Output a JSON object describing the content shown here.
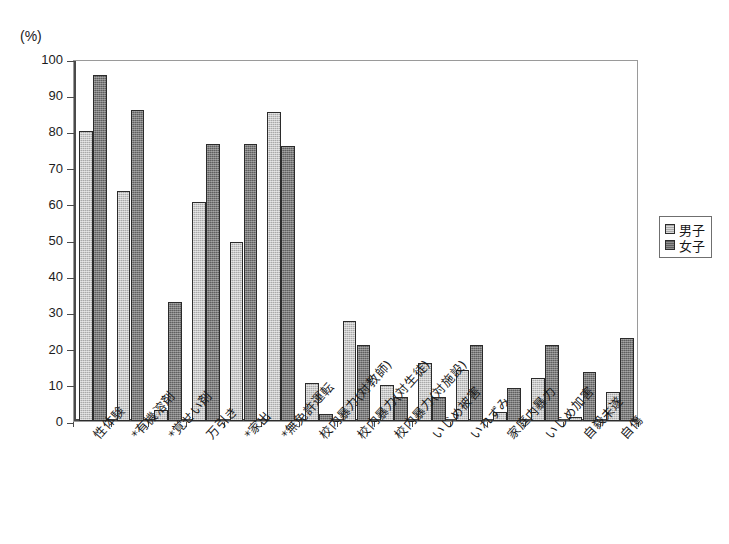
{
  "chart_data": {
    "type": "bar",
    "title": "",
    "xlabel": "",
    "ylabel": "(%)",
    "unit_label": "(%)",
    "ylim": [
      0,
      100
    ],
    "ytick_step": 10,
    "ytick_labels": [
      "0",
      "10",
      "20",
      "30",
      "40",
      "50",
      "60",
      "70",
      "80",
      "90",
      "100"
    ],
    "grid": false,
    "legend_position": "right",
    "categories": [
      "性体験",
      "*有機溶剤",
      "*覚せい剤",
      "万引き",
      "*家出",
      "*無免許運転",
      "校内暴力(対教師)",
      "校内暴力(対生徒)",
      "校内暴力(対施設)",
      "いじめ被害",
      "いれずみ",
      "家庭内暴力",
      "いじめ加害",
      "自殺未遂",
      "自傷"
    ],
    "series": [
      {
        "name": "男子",
        "color": "#a9a9a9",
        "values": [
          80,
          63.5,
          3,
          60.5,
          49.5,
          85.5,
          10.5,
          27.5,
          10,
          16,
          14,
          2.5,
          12,
          1,
          8
        ]
      },
      {
        "name": "女子",
        "color": "#5f5f5f",
        "values": [
          95.5,
          86,
          33,
          76.5,
          76.5,
          76,
          2,
          21,
          6.7,
          6.7,
          21,
          9,
          21,
          13.5,
          23
        ]
      }
    ]
  },
  "legend": {
    "items": [
      {
        "label": "男子",
        "swatch": "light-gray"
      },
      {
        "label": "女子",
        "swatch": "dark-gray"
      }
    ]
  },
  "colors": {
    "male_bar": "#a9a9a9",
    "female_bar": "#5f5f5f",
    "axis": "#4a4a4a",
    "frame": "#9a9a9a",
    "background": "#ffffff"
  }
}
